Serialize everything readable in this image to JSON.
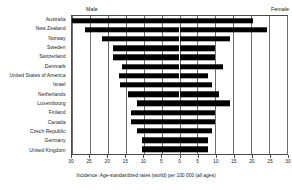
{
  "chart_data": {
    "type": "bar",
    "orientation": "horizontal",
    "layout": "diverging-population-pyramid",
    "title": "",
    "subtitle": "",
    "xlabel": "Incidence: Age-standardized rates (world) per 100 000 (all ages)",
    "ylabel": "",
    "xlim": [
      -30,
      30
    ],
    "xticks": [
      -30,
      -25,
      -20,
      -15,
      -10,
      -5,
      0,
      5,
      10,
      15,
      20,
      25,
      30
    ],
    "xticklabels": [
      "30",
      "25",
      "20",
      "15",
      "10",
      "5",
      "0",
      "5",
      "10",
      "15",
      "20",
      "25",
      "30"
    ],
    "grid": true,
    "grid_axis": "x",
    "legend_position": "top",
    "bar_color": "#000000",
    "categories": [
      "Australia",
      "New Zealand",
      "Norway",
      "Sweden",
      "Switzerland",
      "Denmark",
      "United States of America",
      "Israel",
      "Netherlands",
      "Luxembourg",
      "Finland",
      "Canada",
      "Czech Republic",
      "Germany",
      "United Kingdom"
    ],
    "series": [
      {
        "name": "Male",
        "side": "left",
        "values": [
          30.0,
          26.5,
          21.5,
          18.5,
          18.5,
          16.0,
          17.0,
          16.5,
          14.5,
          12.0,
          13.5,
          13.5,
          12.0,
          10.5,
          10.5
        ]
      },
      {
        "name": "Female",
        "side": "right",
        "values": [
          20.5,
          24.5,
          14.0,
          10.0,
          10.0,
          12.0,
          8.0,
          9.0,
          11.0,
          14.0,
          10.0,
          10.0,
          9.0,
          8.0,
          8.0
        ]
      }
    ],
    "annotations": []
  },
  "header": {
    "male_label": "Male",
    "female_label": "Female"
  },
  "caption": {
    "text": "Incidence: Age-standardized rates (world) per 100 000 (all ages)"
  }
}
